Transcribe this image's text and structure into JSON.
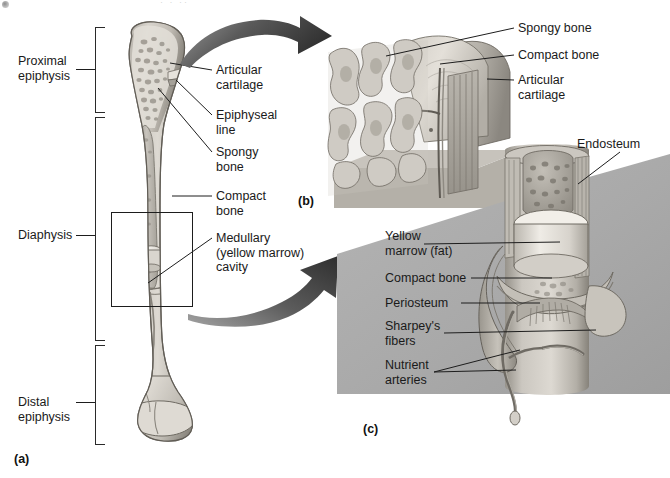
{
  "figure": {
    "top_crumb": "· · ··",
    "panel_tags": [
      {
        "id": "a",
        "label": "(a)"
      },
      {
        "id": "b",
        "label": "(b)"
      },
      {
        "id": "c",
        "label": "(c)"
      }
    ]
  },
  "panel_a": {
    "region_labels": [
      {
        "key": "proximal",
        "text": "Proximal\nepiphysis"
      },
      {
        "key": "diaphysis",
        "text": "Diaphysis"
      },
      {
        "key": "distal",
        "text": "Distal\nepiphysis"
      }
    ],
    "callouts": [
      {
        "key": "articular-cartilage",
        "text": "Articular\ncartilage"
      },
      {
        "key": "epiphyseal-line",
        "text": "Epiphyseal\nline"
      },
      {
        "key": "spongy-bone",
        "text": "Spongy\nbone"
      },
      {
        "key": "compact-bone",
        "text": "Compact\nbone"
      },
      {
        "key": "medullary-cavity",
        "text": "Medullary\n(yellow marrow)\ncavity"
      }
    ]
  },
  "panel_b": {
    "callouts": [
      {
        "key": "spongy-bone",
        "text": "Spongy bone"
      },
      {
        "key": "compact-bone",
        "text": "Compact bone"
      },
      {
        "key": "articular-cartilage",
        "text": "Articular\ncartilage"
      }
    ]
  },
  "panel_c": {
    "callouts": [
      {
        "key": "endosteum",
        "text": "Endosteum"
      },
      {
        "key": "yellow-marrow",
        "text": "Yellow\nmarrow (fat)"
      },
      {
        "key": "compact-bone",
        "text": "Compact bone"
      },
      {
        "key": "periosteum",
        "text": "Periosteum"
      },
      {
        "key": "sharpeys-fibers",
        "text": "Sharpey's\nfibers"
      },
      {
        "key": "nutrient-arteries",
        "text": "Nutrient\narteries"
      }
    ]
  },
  "colors": {
    "background": "#ffffff",
    "text": "#1a1a1a",
    "leader_line": "#1d1d1d",
    "arrow_dark": "#4a4a4a",
    "panel_c_bg": "#a9a9a9",
    "bone_light": "#d9d6d0",
    "bone_mid": "#b9b5ad",
    "bone_dark": "#8e8a82",
    "bone_outline": "#6e6a62",
    "marrow": "#efece6"
  }
}
